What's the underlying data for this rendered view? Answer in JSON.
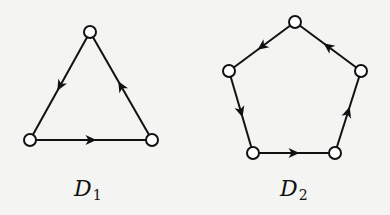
{
  "graphs": [
    {
      "name": "D1",
      "label": "D",
      "subscript": "1",
      "nodes": [
        "a",
        "b",
        "c"
      ],
      "directed_edges": [
        [
          "a",
          "b"
        ],
        [
          "b",
          "c"
        ],
        [
          "c",
          "a"
        ]
      ]
    },
    {
      "name": "D2",
      "label": "D",
      "subscript": "2",
      "nodes": [
        "a",
        "b",
        "c",
        "d",
        "e"
      ],
      "directed_edges": [
        [
          "a",
          "b"
        ],
        [
          "b",
          "c"
        ],
        [
          "c",
          "d"
        ],
        [
          "d",
          "e"
        ],
        [
          "e",
          "a"
        ]
      ]
    }
  ],
  "colors": {
    "stroke": "#111111",
    "node_fill": "#ffffff",
    "background": "#f4f4f2"
  }
}
